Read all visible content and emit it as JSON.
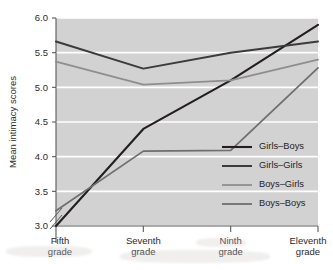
{
  "chart_data": {
    "type": "line",
    "title": "",
    "xlabel": "",
    "ylabel": "Mean intimacy scores",
    "categories": [
      "Fifth\ngrade",
      "Seventh\ngrade",
      "Ninth\ngrade",
      "Eleventh\ngrade"
    ],
    "category_lines": [
      [
        "Fifth",
        "grade"
      ],
      [
        "Seventh",
        "grade"
      ],
      [
        "Ninth",
        "grade"
      ],
      [
        "Eleventh",
        "grade"
      ]
    ],
    "ylim": [
      3.0,
      6.0
    ],
    "yticks": [
      3.0,
      3.5,
      4.0,
      4.5,
      5.0,
      5.5,
      6.0
    ],
    "ytick_labels": [
      "3.0",
      "3.5",
      "4.0",
      "4.5",
      "5.0",
      "5.5",
      "6.0"
    ],
    "axis_break": true,
    "grid": true,
    "grid_axis": "y",
    "legend_position": "bottom-right",
    "series": [
      {
        "name": "Girls–Boys",
        "color": "#231f20",
        "width": 2.1,
        "values": [
          3.0,
          4.4,
          5.1,
          5.9
        ]
      },
      {
        "name": "Girls–Girls",
        "color": "#3d3a3b",
        "width": 2.0,
        "values": [
          5.66,
          5.27,
          5.5,
          5.66
        ]
      },
      {
        "name": "Boys–Girls",
        "color": "#8e8e8e",
        "width": 1.8,
        "values": [
          5.37,
          5.04,
          5.1,
          5.4
        ]
      },
      {
        "name": "Boys–Boys",
        "color": "#6f6f70",
        "width": 1.8,
        "values": [
          3.22,
          4.08,
          4.09,
          5.28
        ]
      }
    ]
  },
  "legend": {
    "entries": [
      {
        "label": "Girls–Boys",
        "color": "#231f20"
      },
      {
        "label": "Girls–Girls",
        "color": "#3d3a3b"
      },
      {
        "label": "Boys–Girls",
        "color": "#8e8e8e"
      },
      {
        "label": "Boys–Boys",
        "color": "#6f6f70"
      }
    ]
  },
  "style": {
    "plot_background": "#d2d2d2",
    "grid_color": "#ffffff",
    "axis_color": "#5a5a5a",
    "text_color": "#2b2b2b",
    "page_background": "#ffffff"
  }
}
